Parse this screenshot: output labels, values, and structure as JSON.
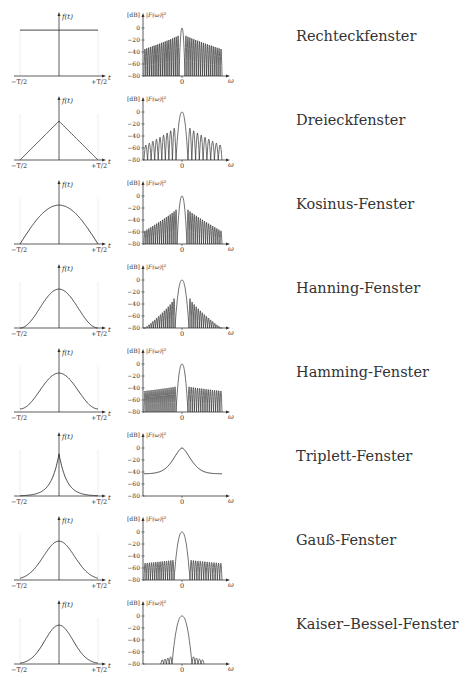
{
  "figure": {
    "caption": "",
    "rows": [
      {
        "name": "Rechteckfenster",
        "shape": "rect",
        "spectrum": "rect"
      },
      {
        "name": "Dreieckfenster",
        "shape": "tri",
        "spectrum": "tri"
      },
      {
        "name": "Kosinus-Fenster",
        "shape": "cos",
        "spectrum": "cos"
      },
      {
        "name": "Hanning-Fenster",
        "shape": "hann",
        "spectrum": "hann"
      },
      {
        "name": "Hamming-Fenster",
        "shape": "hamm",
        "spectrum": "hamm"
      },
      {
        "name": "Triplett-Fenster",
        "shape": "trip",
        "spectrum": "trip"
      },
      {
        "name": "Gauß-Fenster",
        "shape": "gauss",
        "spectrum": "gauss"
      },
      {
        "name": "Kaiser–Bessel-Fenster",
        "shape": "kaiser",
        "spectrum": "kaiser"
      }
    ],
    "time_axis": {
      "ylabel": "f(t)",
      "xlabel": "t",
      "left_tick": "−T/2",
      "right_tick": "+T/2"
    },
    "spectrum_axis": {
      "unit_label": "[dB]",
      "ylabel": "|F(ω)|²",
      "xlabel": "ω",
      "x_tick": "0",
      "y_ticks": [
        "0",
        "−20",
        "−40",
        "−60",
        "−80"
      ]
    },
    "line_color": "#333333"
  },
  "chart_data": [
    {
      "type": "line",
      "title": "Rechteckfenster",
      "panel": "time",
      "xlabel": "t",
      "ylabel": "f(t)",
      "xlim": [
        "-T/2",
        "+T/2"
      ],
      "description": "constant 1 on [-T/2, +T/2]"
    },
    {
      "type": "line",
      "title": "Rechteckfenster",
      "panel": "spectrum",
      "xlabel": "ω",
      "ylabel": "|F(ω)|² [dB]",
      "ylim": [
        -80,
        0
      ],
      "y_ticks": [
        0,
        -20,
        -40,
        -60,
        -80
      ],
      "main_lobe_db": 0,
      "first_sidelobe_db": -13,
      "sidelobe_floor_at_edge_db": -35
    },
    {
      "type": "line",
      "title": "Dreieckfenster",
      "panel": "time",
      "description": "triangle peaking at t=0"
    },
    {
      "type": "line",
      "title": "Dreieckfenster",
      "panel": "spectrum",
      "ylim": [
        -80,
        0
      ],
      "main_lobe_db": 0,
      "first_sidelobe_db": -27,
      "sidelobe_floor_at_edge_db": -55
    },
    {
      "type": "line",
      "title": "Kosinus-Fenster",
      "panel": "time",
      "description": "half cosine, nonzero peak, zero at edges"
    },
    {
      "type": "line",
      "title": "Kosinus-Fenster",
      "panel": "spectrum",
      "ylim": [
        -80,
        0
      ],
      "main_lobe_db": 0,
      "first_sidelobe_db": -23,
      "sidelobe_floor_at_edge_db": -58
    },
    {
      "type": "line",
      "title": "Hanning-Fenster",
      "panel": "time",
      "description": "raised cosine bell"
    },
    {
      "type": "line",
      "title": "Hanning-Fenster",
      "panel": "spectrum",
      "ylim": [
        -80,
        0
      ],
      "main_lobe_db": 0,
      "first_sidelobe_db": -31,
      "sidelobe_floor_at_edge_db": -80
    },
    {
      "type": "line",
      "title": "Hamming-Fenster",
      "panel": "time",
      "description": "raised cosine with small pedestal"
    },
    {
      "type": "line",
      "title": "Hamming-Fenster",
      "panel": "spectrum",
      "ylim": [
        -80,
        0
      ],
      "main_lobe_db": 0,
      "first_sidelobe_db": -38,
      "sidelobe_floor_at_edge_db": -45
    },
    {
      "type": "line",
      "title": "Triplett-Fenster",
      "panel": "time",
      "description": "cusp-shaped exponential peak"
    },
    {
      "type": "line",
      "title": "Triplett-Fenster",
      "panel": "spectrum",
      "ylim": [
        -80,
        0
      ],
      "main_lobe_db": 0,
      "edge_level_db": -43,
      "description": "smooth, no sidelobes"
    },
    {
      "type": "line",
      "title": "Gauß-Fenster",
      "panel": "time",
      "description": "gaussian bell"
    },
    {
      "type": "line",
      "title": "Gauß-Fenster",
      "panel": "spectrum",
      "ylim": [
        -80,
        0
      ],
      "main_lobe_db": 0,
      "first_sidelobe_db": -47,
      "sidelobe_floor_at_edge_db": -52
    },
    {
      "type": "line",
      "title": "Kaiser–Bessel-Fenster",
      "panel": "time",
      "description": "bell-shaped"
    },
    {
      "type": "line",
      "title": "Kaiser–Bessel-Fenster",
      "panel": "spectrum",
      "ylim": [
        -80,
        0
      ],
      "main_lobe_db": 0,
      "first_sidelobe_db": -68,
      "sidelobe_floor_at_edge_db": -80
    }
  ]
}
